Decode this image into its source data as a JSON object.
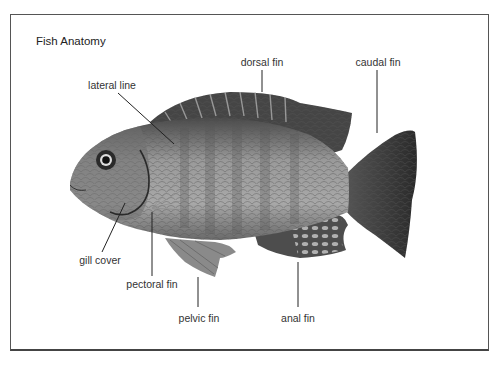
{
  "title": "Fish Anatomy",
  "labels": {
    "dorsal_fin": "dorsal fin",
    "caudal_fin": "caudal fin",
    "lateral_line": "lateral line",
    "gill_cover": "gill cover",
    "pectoral_fin": "pectoral fin",
    "pelvic_fin": "pelvic fin",
    "anal_fin": "anal fin"
  },
  "colors": {
    "frame": "#555555",
    "text": "#333333",
    "leader": "#222222",
    "fish_body": "#8a8a8a",
    "fish_dark": "#3a3a3a"
  }
}
